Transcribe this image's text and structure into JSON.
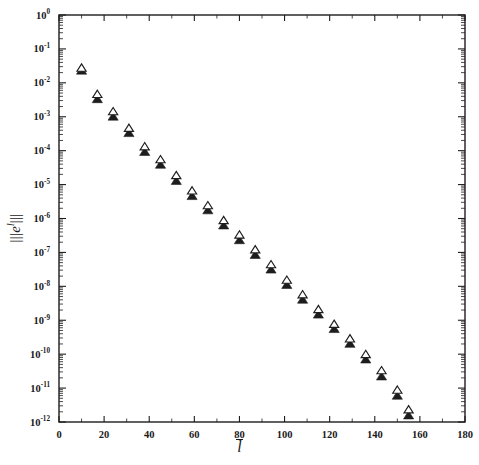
{
  "figure": {
    "background_color": "#ffffff",
    "ink_color": "#1d1d1d",
    "width": 479,
    "height": 465
  },
  "axes": {
    "x": {
      "label": "l",
      "label_has_overbar": true,
      "scale": "linear",
      "min": 0,
      "max": 180,
      "tick_step": 20,
      "minor_tick_step": 10,
      "tick_labels": [
        "0",
        "20",
        "40",
        "60",
        "80",
        "100",
        "120",
        "140",
        "160",
        "180"
      ],
      "tick_values": [
        0,
        20,
        40,
        60,
        80,
        100,
        120,
        140,
        160,
        180
      ]
    },
    "y": {
      "label_parts": {
        "norm_bars": "|||",
        "base": "e",
        "superscript": "l"
      },
      "label_plain": "||| e^l |||",
      "scale": "log10",
      "min": 1e-12,
      "max": 1,
      "exponent_min": -12,
      "exponent_max": 0,
      "tick_labels": [
        "10^0",
        "10^-1",
        "10^-2",
        "10^-3",
        "10^-4",
        "10^-5",
        "10^-6",
        "10^-7",
        "10^-8",
        "10^-9",
        "10^-10",
        "10^-11",
        "10^-12"
      ],
      "tick_mantissa": "10",
      "tick_exponents": [
        "0",
        "-1",
        "-2",
        "-3",
        "-4",
        "-5",
        "-6",
        "-7",
        "-8",
        "-9",
        "-10",
        "-11",
        "-12"
      ],
      "minor_ticks": true
    },
    "frame": {
      "top": true,
      "right": true,
      "bottom": true,
      "left": true
    },
    "grid": false,
    "legend": null,
    "title": ""
  },
  "chart_data": {
    "type": "scatter",
    "title": "",
    "xlabel": "l̄",
    "ylabel": "||| e^l̄ |||",
    "xlim": [
      0,
      180
    ],
    "ylim": [
      1e-12,
      1
    ],
    "yscale": "log",
    "xscale": "linear",
    "grid": false,
    "legend_position": "none",
    "series": [
      {
        "name": "open-triangle",
        "marker": "triangle-up-open",
        "color": "#1d1d1d",
        "fill": "#ffffff",
        "x": [
          10,
          17,
          24,
          31,
          38,
          45,
          52,
          59,
          66,
          73,
          80,
          87,
          94,
          101,
          108,
          115,
          122,
          129,
          136,
          143,
          150,
          155
        ],
        "y": [
          0.025,
          0.0042,
          0.0013,
          0.00042,
          0.00012,
          5e-05,
          1.7e-05,
          6e-06,
          2.2e-06,
          8e-07,
          3e-07,
          1.1e-07,
          4e-08,
          1.4e-08,
          5.2e-09,
          1.9e-09,
          7e-10,
          2.6e-10,
          9e-11,
          3e-11,
          8e-12,
          2.1e-12
        ]
      },
      {
        "name": "filled-triangle",
        "marker": "triangle-up-filled",
        "color": "#1d1d1d",
        "fill": "#1d1d1d",
        "x": [
          10,
          17,
          24,
          31,
          38,
          45,
          52,
          59,
          66,
          73,
          80,
          87,
          94,
          101,
          108,
          115,
          122,
          129,
          136,
          143,
          150,
          155
        ],
        "y": [
          0.025,
          0.0036,
          0.0011,
          0.00036,
          0.0001,
          4.2e-05,
          1.4e-05,
          5e-06,
          1.9e-06,
          6.8e-07,
          2.5e-07,
          9.2e-08,
          3.4e-08,
          1.2e-08,
          4.4e-09,
          1.6e-09,
          6e-10,
          2.2e-10,
          7.6e-11,
          2.4e-11,
          6.5e-12,
          1.7e-12
        ]
      }
    ]
  }
}
